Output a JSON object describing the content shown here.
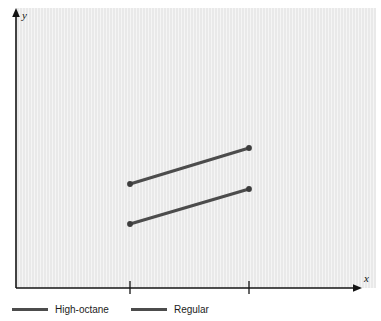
{
  "figure": {
    "background_color": "#ffffff",
    "panel_color": "#e9e9e9",
    "axis_color": "#141414",
    "series_color": "#4c4c4c"
  },
  "axes": {
    "x_label": "x",
    "y_label": "y",
    "x_tick_labels": [
      "",
      ""
    ],
    "y_tick_labels": []
  },
  "legend": {
    "items": [
      {
        "label": "High-octane",
        "color": "#4c4c4c"
      },
      {
        "label": "Regular",
        "color": "#4c4c4c"
      }
    ]
  },
  "chart_data": {
    "type": "line",
    "title": "",
    "xlabel": "x",
    "ylabel": "y",
    "grid": false,
    "legend_position": "bottom-left",
    "x_axis": {
      "ticks": [
        1,
        2
      ],
      "tick_labels": [
        "",
        ""
      ],
      "labelled": false,
      "arrow": true
    },
    "y_axis": {
      "ticks": [],
      "tick_labels": [],
      "labelled": false,
      "arrow": true
    },
    "categories": [
      1,
      2
    ],
    "series": [
      {
        "name": "High-octane",
        "color": "#4c4c4c",
        "marker": "circle",
        "x": [
          1,
          2
        ],
        "values": [
          0.372,
          0.5
        ],
        "points_px": [
          [
            130,
            184
          ],
          [
            249,
            148
          ]
        ]
      },
      {
        "name": "Regular",
        "color": "#4c4c4c",
        "marker": "circle",
        "x": [
          1,
          2
        ],
        "values": [
          0.229,
          0.354
        ],
        "points_px": [
          [
            130,
            224
          ],
          [
            249,
            189
          ]
        ]
      }
    ],
    "annotations": []
  }
}
